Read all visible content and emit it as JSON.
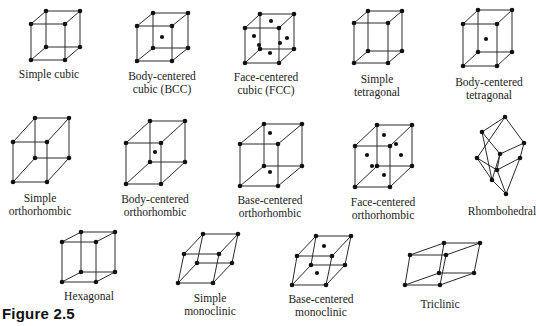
{
  "figure": {
    "caption": "Figure 2.5"
  },
  "colors": {
    "line": "#2a2a2a",
    "atom": "#111111",
    "background": "#ffffff"
  },
  "lattices": [
    {
      "id": "simple-cubic",
      "label_lines": [
        "Simple cubic"
      ],
      "centering": "P",
      "system": "cubic",
      "front": [
        [
          31,
          24
        ],
        [
          65,
          24
        ],
        [
          65,
          60
        ],
        [
          31,
          60
        ]
      ],
      "offset": [
        15,
        -13
      ],
      "extra": [],
      "label_pos": [
        49,
        68
      ]
    },
    {
      "id": "bcc",
      "label_lines": [
        "Body-centered",
        "cubic (BCC)"
      ],
      "centering": "I",
      "system": "cubic",
      "front": [
        [
          137,
          26
        ],
        [
          172,
          26
        ],
        [
          172,
          61
        ],
        [
          137,
          61
        ]
      ],
      "offset": [
        16,
        -13
      ],
      "extra": [
        [
          162,
          37
        ]
      ],
      "label_pos": [
        162,
        70
      ]
    },
    {
      "id": "fcc",
      "label_lines": [
        "Face-centered",
        "cubic (FCC)"
      ],
      "centering": "F",
      "system": "cubic",
      "front": [
        [
          245,
          28
        ],
        [
          279,
          28
        ],
        [
          279,
          63
        ],
        [
          245,
          63
        ]
      ],
      "offset": [
        15,
        -14
      ],
      "extra": [
        [
          254,
          36
        ],
        [
          271,
          21
        ],
        [
          287,
          38
        ],
        [
          270,
          53
        ],
        [
          259,
          45
        ],
        [
          280,
          43
        ]
      ],
      "label_pos": [
        266,
        71
      ]
    },
    {
      "id": "simple-tetragonal",
      "label_lines": [
        "Simple",
        "tetragonal"
      ],
      "centering": "P",
      "system": "tetragonal",
      "front": [
        [
          354,
          23
        ],
        [
          388,
          23
        ],
        [
          388,
          63
        ],
        [
          354,
          63
        ]
      ],
      "offset": [
        14,
        -12
      ],
      "extra": [],
      "label_pos": [
        377,
        73
      ]
    },
    {
      "id": "bct",
      "label_lines": [
        "Body-centered",
        "tetragonal"
      ],
      "centering": "I",
      "system": "tetragonal",
      "front": [
        [
          463,
          24
        ],
        [
          497,
          24
        ],
        [
          497,
          66
        ],
        [
          463,
          66
        ]
      ],
      "offset": [
        15,
        -14
      ],
      "extra": [
        [
          486,
          39
        ]
      ],
      "label_pos": [
        489,
        76
      ]
    },
    {
      "id": "simple-orthorhombic",
      "label_lines": [
        "Simple",
        "orthorhombic"
      ],
      "centering": "P",
      "system": "orthorhombic",
      "front": [
        [
          13,
          142
        ],
        [
          47,
          142
        ],
        [
          47,
          182
        ],
        [
          13,
          182
        ]
      ],
      "offset": [
        22,
        -24
      ],
      "extra": [],
      "label_pos": [
        40,
        192
      ]
    },
    {
      "id": "body-centered-orthorhombic",
      "label_lines": [
        "Body-centered",
        "orthorhombic"
      ],
      "centering": "I",
      "system": "orthorhombic",
      "front": [
        [
          126,
          143
        ],
        [
          161,
          143
        ],
        [
          161,
          184
        ],
        [
          126,
          184
        ]
      ],
      "offset": [
        24,
        -22
      ],
      "extra": [
        [
          155,
          152
        ]
      ],
      "label_pos": [
        155,
        193
      ]
    },
    {
      "id": "base-centered-orthorhombic",
      "label_lines": [
        "Base-centered",
        "orthorhombic"
      ],
      "centering": "C",
      "system": "orthorhombic",
      "front": [
        [
          240,
          144
        ],
        [
          278,
          144
        ],
        [
          278,
          186
        ],
        [
          240,
          186
        ]
      ],
      "offset": [
        24,
        -20
      ],
      "extra": [
        [
          270,
          133
        ],
        [
          270,
          172
        ]
      ],
      "label_pos": [
        270,
        194
      ]
    },
    {
      "id": "face-centered-orthorhombic",
      "label_lines": [
        "Face-centered",
        "orthorhombic"
      ],
      "centering": "F",
      "system": "orthorhombic",
      "front": [
        [
          355,
          146
        ],
        [
          390,
          146
        ],
        [
          390,
          187
        ],
        [
          355,
          187
        ]
      ],
      "offset": [
        22,
        -21
      ],
      "extra": [
        [
          384,
          135
        ],
        [
          367,
          155
        ],
        [
          401,
          155
        ],
        [
          384,
          175
        ],
        [
          372,
          166
        ],
        [
          396,
          144
        ]
      ],
      "label_pos": [
        383,
        196
      ]
    },
    {
      "id": "rhombohedral",
      "label_lines": [
        "Rhombohedral"
      ],
      "centering": "R",
      "system": "trigonal",
      "rhombo": true,
      "label_pos": [
        502,
        205
      ]
    },
    {
      "id": "hexagonal",
      "label_lines": [
        "Hexagonal"
      ],
      "centering": "P",
      "system": "hexagonal",
      "front": [
        [
          62,
          242
        ],
        [
          96,
          242
        ],
        [
          96,
          282
        ],
        [
          62,
          282
        ]
      ],
      "offset": [
        19,
        -10
      ],
      "extra": [],
      "label_pos": [
        89,
        290
      ]
    },
    {
      "id": "simple-monoclinic",
      "label_lines": [
        "Simple",
        "monoclinic"
      ],
      "centering": "P",
      "system": "monoclinic",
      "front": [
        [
          184,
          254
        ],
        [
          219,
          254
        ],
        [
          213,
          283
        ],
        [
          178,
          283
        ]
      ],
      "offset": [
        19,
        -20
      ],
      "extra": [],
      "label_pos": [
        210,
        292
      ]
    },
    {
      "id": "base-centered-monoclinic",
      "label_lines": [
        "Base-centered",
        "monoclinic"
      ],
      "centering": "C",
      "system": "monoclinic",
      "front": [
        [
          297,
          256
        ],
        [
          332,
          256
        ],
        [
          326,
          285
        ],
        [
          292,
          285
        ]
      ],
      "offset": [
        19,
        -20
      ],
      "extra": [
        [
          324,
          246
        ],
        [
          317,
          273
        ]
      ],
      "label_pos": [
        321,
        293
      ]
    },
    {
      "id": "triclinic",
      "label_lines": [
        "Triclinic"
      ],
      "centering": "P",
      "system": "triclinic",
      "front": [
        [
          410,
          255
        ],
        [
          446,
          255
        ],
        [
          440,
          285
        ],
        [
          405,
          285
        ]
      ],
      "offset": [
        34,
        -12
      ],
      "extra": [],
      "label_pos": [
        440,
        298
      ]
    }
  ]
}
